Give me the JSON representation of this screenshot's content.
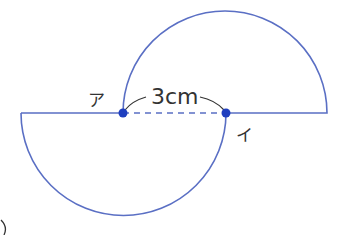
{
  "diagram": {
    "type": "two-semicircles",
    "line_color": "#5a6fc4",
    "point_color": "#1f3fbf",
    "label_color": "#333333",
    "points": [
      {
        "label": "ア",
        "x": 123,
        "y": 113
      },
      {
        "label": "イ",
        "x": 226,
        "y": 113
      }
    ],
    "measurement": {
      "value": "3",
      "unit": "cm",
      "text": "3cm"
    },
    "label_a": "ア",
    "label_i": "イ"
  }
}
